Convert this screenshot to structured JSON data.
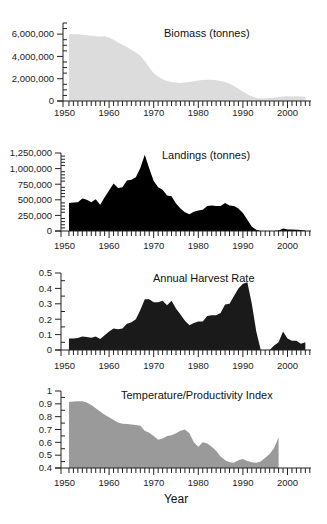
{
  "chart_data": [
    {
      "type": "area",
      "title": "Biomass (tonnes)",
      "xlabel": "",
      "ylabel": "",
      "xlim": [
        1950,
        2005
      ],
      "ylim": [
        0,
        7000000
      ],
      "yticks": [
        0,
        2000000,
        4000000,
        6000000
      ],
      "ytick_labels": [
        "0",
        "2,000,000",
        "4,000,000",
        "6,000,000"
      ],
      "xticks": [
        1950,
        1960,
        1970,
        1980,
        1990,
        2000
      ],
      "xtick_labels": [
        "1950",
        "1960",
        "1970",
        "1980",
        "1990",
        "2000"
      ],
      "fill_color": "#dcdcdc",
      "x": [
        1951,
        1952,
        1953,
        1954,
        1955,
        1956,
        1957,
        1958,
        1959,
        1960,
        1961,
        1962,
        1963,
        1964,
        1965,
        1966,
        1967,
        1968,
        1969,
        1970,
        1971,
        1972,
        1973,
        1974,
        1975,
        1976,
        1977,
        1978,
        1979,
        1980,
        1981,
        1982,
        1983,
        1984,
        1985,
        1986,
        1987,
        1988,
        1989,
        1990,
        1991,
        1992,
        1993,
        1994,
        1995,
        1996,
        1997,
        1998,
        1999,
        2000,
        2001,
        2002,
        2003,
        2004
      ],
      "values": [
        6000000,
        6000000,
        6000000,
        5950000,
        5900000,
        5850000,
        5800000,
        5780000,
        5820000,
        5700000,
        5500000,
        5250000,
        5050000,
        4850000,
        4600000,
        4350000,
        4050000,
        3600000,
        3000000,
        2500000,
        2200000,
        1950000,
        1800000,
        1700000,
        1650000,
        1620000,
        1650000,
        1700000,
        1780000,
        1850000,
        1880000,
        1900000,
        1900000,
        1870000,
        1800000,
        1700000,
        1550000,
        1350000,
        1100000,
        850000,
        600000,
        400000,
        280000,
        230000,
        230000,
        260000,
        300000,
        360000,
        400000,
        420000,
        400000,
        420000,
        400000,
        380000
      ]
    },
    {
      "type": "area",
      "title": "Landings (tonnes)",
      "xlabel": "",
      "ylabel": "",
      "xlim": [
        1950,
        2005
      ],
      "ylim": [
        0,
        1250000
      ],
      "yticks": [
        0,
        250000,
        500000,
        750000,
        1000000,
        1250000
      ],
      "ytick_labels": [
        "0",
        "250,000",
        "500,000",
        "750,000",
        "1,000,000",
        "1,250,000"
      ],
      "xticks": [
        1950,
        1960,
        1970,
        1980,
        1990,
        2000
      ],
      "xtick_labels": [
        "1950",
        "1960",
        "1970",
        "1980",
        "1990",
        "2000"
      ],
      "fill_color": "#000000",
      "x": [
        1951,
        1952,
        1953,
        1954,
        1955,
        1956,
        1957,
        1958,
        1959,
        1960,
        1961,
        1962,
        1963,
        1964,
        1965,
        1966,
        1967,
        1968,
        1969,
        1970,
        1971,
        1972,
        1973,
        1974,
        1975,
        1976,
        1977,
        1978,
        1979,
        1980,
        1981,
        1982,
        1983,
        1984,
        1985,
        1986,
        1987,
        1988,
        1989,
        1990,
        1991,
        1992,
        1993,
        1994,
        1995,
        1996,
        1997,
        1998,
        1999,
        2000,
        2001,
        2002,
        2003,
        2004
      ],
      "values": [
        450000,
        455000,
        460000,
        520000,
        500000,
        460000,
        510000,
        420000,
        540000,
        650000,
        760000,
        690000,
        700000,
        810000,
        820000,
        860000,
        1010000,
        1220000,
        1000000,
        800000,
        700000,
        660000,
        570000,
        555000,
        440000,
        360000,
        300000,
        270000,
        310000,
        330000,
        340000,
        400000,
        410000,
        400000,
        400000,
        450000,
        410000,
        400000,
        360000,
        290000,
        180000,
        70000,
        20000,
        0,
        0,
        0,
        0,
        10000,
        40000,
        25000,
        25000,
        20000,
        15000,
        10000
      ]
    },
    {
      "type": "area",
      "title": "Annual Harvest Rate",
      "xlabel": "",
      "ylabel": "",
      "xlim": [
        1950,
        2005
      ],
      "ylim": [
        0,
        0.5
      ],
      "yticks": [
        0,
        0.1,
        0.2,
        0.3,
        0.4,
        0.5
      ],
      "ytick_labels": [
        "0",
        "0.1",
        "0.2",
        "0.3",
        "0.4",
        "0.5"
      ],
      "xticks": [
        1950,
        1960,
        1970,
        1980,
        1990,
        2000
      ],
      "xtick_labels": [
        "1950",
        "1960",
        "1970",
        "1980",
        "1990",
        "2000"
      ],
      "fill_color": "#1a1a1a",
      "x": [
        1951,
        1952,
        1953,
        1954,
        1955,
        1956,
        1957,
        1958,
        1959,
        1960,
        1961,
        1962,
        1963,
        1964,
        1965,
        1966,
        1967,
        1968,
        1969,
        1970,
        1971,
        1972,
        1973,
        1974,
        1975,
        1976,
        1977,
        1978,
        1979,
        1980,
        1981,
        1982,
        1983,
        1984,
        1985,
        1986,
        1987,
        1988,
        1989,
        1990,
        1991,
        1992,
        1993,
        1994,
        1995,
        1996,
        1997,
        1998,
        1999,
        2000,
        2001,
        2002,
        2003,
        2004
      ],
      "values": [
        0.075,
        0.075,
        0.078,
        0.088,
        0.085,
        0.08,
        0.088,
        0.072,
        0.095,
        0.12,
        0.14,
        0.135,
        0.14,
        0.17,
        0.18,
        0.2,
        0.26,
        0.33,
        0.33,
        0.31,
        0.31,
        0.32,
        0.29,
        0.32,
        0.27,
        0.23,
        0.19,
        0.16,
        0.175,
        0.185,
        0.185,
        0.22,
        0.225,
        0.225,
        0.24,
        0.295,
        0.3,
        0.35,
        0.4,
        0.43,
        0.44,
        0.3,
        0.12,
        0.0,
        0.0,
        0.0,
        0.03,
        0.05,
        0.12,
        0.075,
        0.06,
        0.06,
        0.04,
        0.05
      ]
    },
    {
      "type": "area",
      "title": "Temperature/Productivity Index",
      "xlabel": "Year",
      "ylabel": "",
      "xlim": [
        1950,
        2005
      ],
      "ylim": [
        0.4,
        1.0
      ],
      "yticks": [
        0.4,
        0.5,
        0.6,
        0.7,
        0.8,
        0.9,
        1.0
      ],
      "ytick_labels": [
        "0.4",
        "0.5",
        "0.6",
        "0.7",
        "0.8",
        "0.9",
        "1"
      ],
      "xticks": [
        1950,
        1960,
        1970,
        1980,
        1990,
        2000
      ],
      "xtick_labels": [
        "1950",
        "1960",
        "1970",
        "1980",
        "1990",
        "2000"
      ],
      "fill_color": "#9a9a9a",
      "x": [
        1951,
        1952,
        1953,
        1954,
        1955,
        1956,
        1957,
        1958,
        1959,
        1960,
        1961,
        1962,
        1963,
        1964,
        1965,
        1966,
        1967,
        1968,
        1969,
        1970,
        1971,
        1972,
        1973,
        1974,
        1975,
        1976,
        1977,
        1978,
        1979,
        1980,
        1981,
        1982,
        1983,
        1984,
        1985,
        1986,
        1987,
        1988,
        1989,
        1990,
        1991,
        1992,
        1993,
        1994,
        1995,
        1996,
        1997,
        1998
      ],
      "values": [
        0.915,
        0.918,
        0.92,
        0.92,
        0.91,
        0.89,
        0.865,
        0.84,
        0.815,
        0.795,
        0.775,
        0.755,
        0.745,
        0.742,
        0.738,
        0.735,
        0.73,
        0.69,
        0.675,
        0.65,
        0.62,
        0.63,
        0.65,
        0.655,
        0.67,
        0.69,
        0.7,
        0.67,
        0.6,
        0.565,
        0.6,
        0.59,
        0.565,
        0.535,
        0.49,
        0.46,
        0.445,
        0.44,
        0.46,
        0.47,
        0.455,
        0.445,
        0.44,
        0.45,
        0.48,
        0.51,
        0.555,
        0.64
      ]
    }
  ]
}
